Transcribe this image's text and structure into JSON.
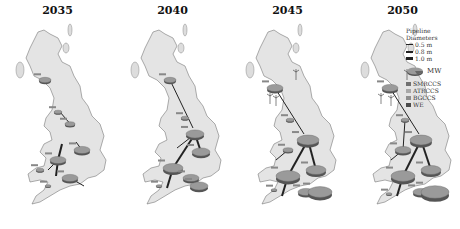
{
  "figure": {
    "panels": [
      {
        "year": "2035"
      },
      {
        "year": "2040"
      },
      {
        "year": "2045"
      },
      {
        "year": "2050"
      }
    ]
  },
  "legend": {
    "title_line1": "Pipeline",
    "title_line2": "Diameters",
    "pipes": [
      {
        "label": "0.5 m",
        "width": 1
      },
      {
        "label": "0.8 m",
        "width": 2
      },
      {
        "label": "1.0 m",
        "width": 3
      }
    ],
    "pie_label": "MW",
    "technologies": [
      {
        "label": "SMRCCS",
        "color": "#707070"
      },
      {
        "label": "ATRCCS",
        "color": "#a8a8a8"
      },
      {
        "label": "BGCCS",
        "color": "#8e8e8e"
      },
      {
        "label": "WE",
        "color": "#4a4a4a"
      }
    ]
  },
  "colors": {
    "land": "#e4e4e4",
    "outline": "#777777",
    "pie_top": "#9a9a9a",
    "pie_side": "#555555",
    "pipeline": "#222222"
  }
}
